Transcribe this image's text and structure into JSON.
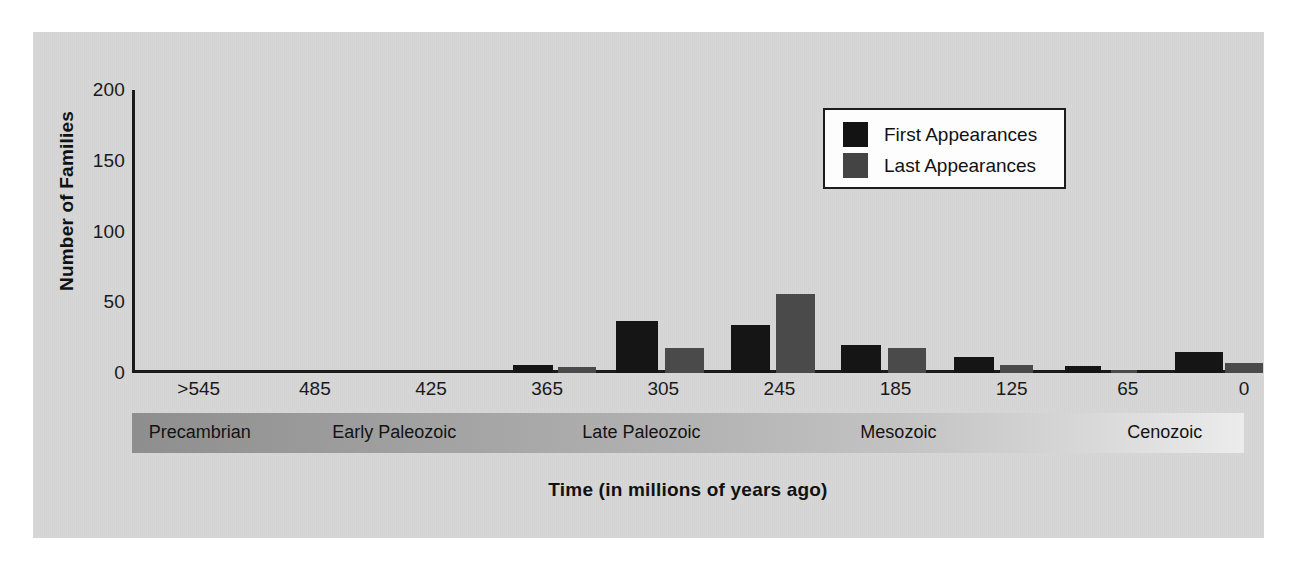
{
  "chart_data": {
    "type": "bar",
    "title": "",
    "xlabel": "Time (in millions of years ago)",
    "ylabel": "Number of Families",
    "ylim": [
      0,
      200
    ],
    "yticks": [
      0,
      50,
      100,
      150,
      200
    ],
    "xticks": [
      ">545",
      "485",
      "425",
      "365",
      "305",
      "245",
      "185",
      "125",
      "65",
      "0"
    ],
    "xlim_labels": {
      "left": ">545",
      "right": "0"
    },
    "grid": false,
    "legend_position": "upper right",
    "legend": [
      "First Appearances",
      "Last Appearances"
    ],
    "colors": {
      "first_appearances": "#151515",
      "last_appearances": "#4a4a4a",
      "panel_background": "#d6d6d6",
      "axis": "#1b1b1b",
      "page_background": "#ffffff"
    },
    "bin_centers_mya": [
      455,
      425,
      395,
      365,
      335,
      305,
      275,
      245,
      215,
      185,
      155,
      125,
      95,
      65,
      35,
      10
    ],
    "series": [
      {
        "name": "First Appearances",
        "color": "#151515",
        "values": [
          0,
          0,
          0,
          0,
          6,
          0,
          37,
          0,
          34,
          0,
          20,
          0,
          11,
          0,
          5,
          0,
          15,
          0
        ]
      },
      {
        "name": "Last Appearances",
        "color": "#4a4a4a",
        "values": [
          0,
          0,
          0,
          0,
          0,
          4,
          0,
          18,
          0,
          56,
          0,
          18,
          0,
          6,
          0,
          2,
          0,
          7
        ]
      }
    ],
    "bars": [
      {
        "series": "First Appearances",
        "value": 6,
        "x_left_pct": 34.3,
        "width_pct": 3.6
      },
      {
        "series": "Last Appearances",
        "value": 4,
        "x_left_pct": 38.3,
        "width_pct": 3.4
      },
      {
        "series": "First Appearances",
        "value": 37,
        "x_left_pct": 43.5,
        "width_pct": 3.8
      },
      {
        "series": "Last Appearances",
        "value": 18,
        "x_left_pct": 47.9,
        "width_pct": 3.5
      },
      {
        "series": "First Appearances",
        "value": 34,
        "x_left_pct": 53.9,
        "width_pct": 3.5
      },
      {
        "series": "Last Appearances",
        "value": 56,
        "x_left_pct": 57.9,
        "width_pct": 3.5
      },
      {
        "series": "First Appearances",
        "value": 20,
        "x_left_pct": 63.8,
        "width_pct": 3.6
      },
      {
        "series": "Last Appearances",
        "value": 18,
        "x_left_pct": 68.0,
        "width_pct": 3.4
      },
      {
        "series": "First Appearances",
        "value": 11,
        "x_left_pct": 73.9,
        "width_pct": 3.6
      },
      {
        "series": "Last Appearances",
        "value": 6,
        "x_left_pct": 78.1,
        "width_pct": 2.9
      },
      {
        "series": "First Appearances",
        "value": 5,
        "x_left_pct": 83.9,
        "width_pct": 3.2
      },
      {
        "series": "Last Appearances",
        "value": 2,
        "x_left_pct": 88.0,
        "width_pct": 2.4
      },
      {
        "series": "First Appearances",
        "value": 15,
        "x_left_pct": 93.8,
        "width_pct": 4.3
      },
      {
        "series": "Last Appearances",
        "value": 7,
        "x_left_pct": 98.3,
        "width_pct": 3.4
      }
    ],
    "eras": [
      {
        "label": "Precambrian",
        "start_pct": 0,
        "end_pct": 16.5
      },
      {
        "label": "Early Paleozoic",
        "start_pct": 16.5,
        "end_pct": 39.0
      },
      {
        "label": "Late Paleozoic",
        "start_pct": 39.0,
        "end_pct": 64.0
      },
      {
        "label": "Mesozoic",
        "start_pct": 64.0,
        "end_pct": 88.0
      },
      {
        "label": "Cenozoic",
        "start_pct": 88.0,
        "end_pct": 100.0
      }
    ]
  },
  "axes": {
    "y_title": "Number of Families",
    "y_tick_labels": [
      "200",
      "150",
      "100",
      "50",
      "0"
    ],
    "x_title": "Time (in millions of years ago)",
    "x_tick_labels": [
      ">545",
      "485",
      "425",
      "365",
      "305",
      "245",
      "185",
      "125",
      "65",
      "0"
    ]
  },
  "legend": {
    "items": [
      {
        "label": "First Appearances",
        "swatch": "black-square"
      },
      {
        "label": "Last Appearances",
        "swatch": "gray-square"
      }
    ]
  },
  "era_band": {
    "labels": [
      "Precambrian",
      "Early Paleozoic",
      "Late Paleozoic",
      "Mesozoic",
      "Cenozoic"
    ]
  }
}
